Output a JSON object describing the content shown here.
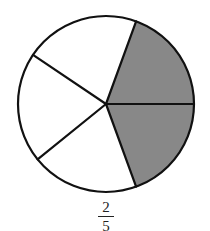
{
  "diagram": {
    "type": "fraction-circle",
    "total_parts": 5,
    "shaded_parts": 2,
    "shade_color": "#888888",
    "unshaded_color": "#ffffff",
    "stroke_color": "#111111",
    "center": [
      106,
      104
    ],
    "radius": 88,
    "sector_boundary_angles_deg": [
      0,
      70,
      141,
      214,
      290
    ],
    "shaded_sectors": [
      [
        290,
        360
      ],
      [
        0,
        70
      ]
    ]
  },
  "fraction": {
    "numerator": "2",
    "denominator": "5"
  }
}
